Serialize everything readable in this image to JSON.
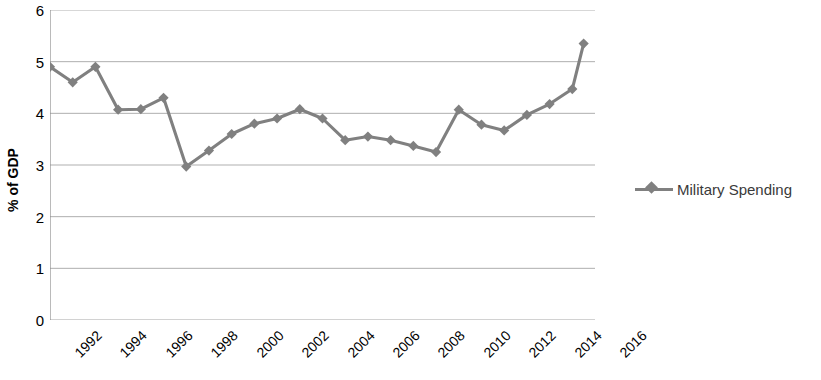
{
  "chart_data": {
    "type": "line",
    "title": "",
    "xlabel": "",
    "ylabel": "% of GDP",
    "ylim": [
      0,
      6
    ],
    "xlim": [
      1992,
      2016
    ],
    "ytick_labels": [
      "0",
      "1",
      "2",
      "3",
      "4",
      "5",
      "6"
    ],
    "ytick_values": [
      0,
      1,
      2,
      3,
      4,
      5,
      6
    ],
    "xtick_labels": [
      "1992",
      "1994",
      "1996",
      "1998",
      "2000",
      "2002",
      "2004",
      "2006",
      "2008",
      "2010",
      "2012",
      "2014",
      "2016"
    ],
    "xtick_values": [
      1992,
      1994,
      1996,
      1998,
      2000,
      2002,
      2004,
      2006,
      2008,
      2010,
      2012,
      2014,
      2016
    ],
    "grid": "horizontal",
    "legend_position": "right",
    "series": [
      {
        "name": "Military Spending",
        "color": "#808080",
        "marker": "diamond",
        "x": [
          1992,
          1993,
          1994,
          1995,
          1996,
          1997,
          1998,
          1999,
          2000,
          2001,
          2002,
          2003,
          2004,
          2005,
          2006,
          2007,
          2008,
          2009,
          2010,
          2011,
          2012,
          2013,
          2014,
          2015
        ],
        "values": [
          4.9,
          4.6,
          4.9,
          4.07,
          4.08,
          4.3,
          2.97,
          3.28,
          3.6,
          3.8,
          3.9,
          4.08,
          3.9,
          3.48,
          3.55,
          3.48,
          3.37,
          3.25,
          4.07,
          3.78,
          3.67,
          3.97,
          4.18,
          4.47
        ]
      }
    ],
    "extra_points": [
      {
        "x": 2015.5,
        "y": 5.35,
        "note": "final value"
      }
    ]
  },
  "legend": {
    "entries": [
      {
        "label": "Military Spending"
      }
    ]
  },
  "axis": {
    "y_title": "% of GDP"
  }
}
